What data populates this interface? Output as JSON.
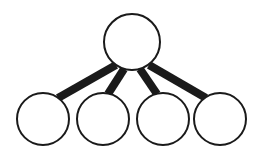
{
  "diagram": {
    "type": "node-link-tree",
    "canvas": {
      "width": 259,
      "height": 156,
      "background": "#ffffff"
    },
    "style": {
      "node_fill": "#ffffff",
      "node_stroke": "#1a1a1a",
      "node_stroke_width": 2,
      "edge_color": "#1a1a1a",
      "edge_width": 8
    },
    "nodes": [
      {
        "id": "root",
        "label": "",
        "role": "parent",
        "cx": 132,
        "cy": 42,
        "r": 28
      },
      {
        "id": "child1",
        "label": "",
        "role": "child",
        "cx": 43,
        "cy": 119,
        "r": 26
      },
      {
        "id": "child2",
        "label": "",
        "role": "child",
        "cx": 103,
        "cy": 119,
        "r": 26
      },
      {
        "id": "child3",
        "label": "",
        "role": "child",
        "cx": 163,
        "cy": 119,
        "r": 26
      },
      {
        "id": "child4",
        "label": "",
        "role": "child",
        "cx": 220,
        "cy": 119,
        "r": 26
      }
    ],
    "edges": [
      {
        "id": "edge-root-child1",
        "from": "root",
        "to": "child1",
        "x1": 116,
        "y1": 65,
        "x2": 58,
        "y2": 98
      },
      {
        "id": "edge-root-child2",
        "from": "root",
        "to": "child2",
        "x1": 124,
        "y1": 69,
        "x2": 108,
        "y2": 94
      },
      {
        "id": "edge-root-child3",
        "from": "root",
        "to": "child3",
        "x1": 140,
        "y1": 69,
        "x2": 157,
        "y2": 94
      },
      {
        "id": "edge-root-child4",
        "from": "root",
        "to": "child4",
        "x1": 149,
        "y1": 65,
        "x2": 206,
        "y2": 98
      }
    ]
  }
}
